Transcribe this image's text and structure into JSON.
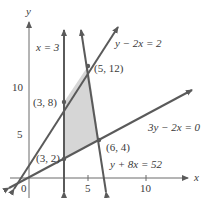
{
  "diagram": {
    "type": "linear-programming-feasible-region",
    "axes": {
      "x_label": "x",
      "y_label": "y",
      "x_ticks": [
        {
          "value": 5,
          "label": "5"
        },
        {
          "value": 10,
          "label": "10"
        }
      ],
      "y_ticks": [
        {
          "value": 5,
          "label": "5"
        },
        {
          "value": 10,
          "label": "10"
        }
      ],
      "origin_label": "0"
    },
    "lines": [
      {
        "id": "x3",
        "equation": "x = 3"
      },
      {
        "id": "y2x2",
        "equation": "y − 2x = 2"
      },
      {
        "id": "3y2x0",
        "equation": "3y − 2x = 0"
      },
      {
        "id": "y8x52",
        "equation": "y + 8x = 52"
      }
    ],
    "vertices": [
      {
        "x": 3,
        "y": 2,
        "label": "(3, 2)"
      },
      {
        "x": 3,
        "y": 8,
        "label": "(3, 8)"
      },
      {
        "x": 5,
        "y": 12,
        "label": "(5, 12)"
      },
      {
        "x": 6,
        "y": 4,
        "label": "(6, 4)"
      }
    ],
    "colors": {
      "line": "#5a5a5a",
      "region_fill": "#d6d6d6",
      "axis": "#6a6a6a",
      "text": "#3a3a3a"
    }
  }
}
